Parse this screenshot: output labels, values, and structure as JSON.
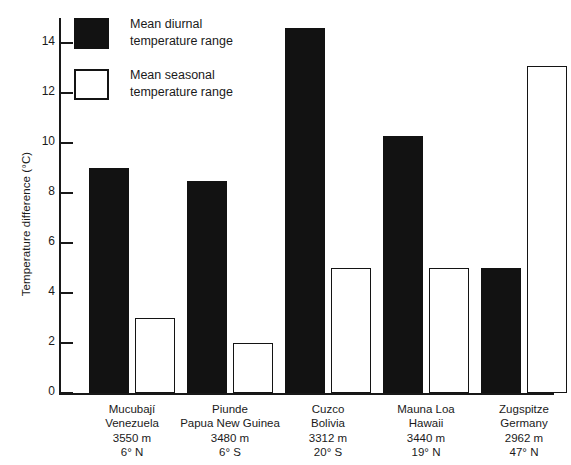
{
  "chart_data": {
    "type": "bar",
    "title": "",
    "xlabel": "",
    "ylabel": "Temperature difference (°C)",
    "ylim": [
      0,
      15
    ],
    "yticks": [
      0,
      2,
      4,
      6,
      8,
      10,
      12,
      14
    ],
    "ytick_labels": [
      "0",
      "2",
      "4",
      "6",
      "8",
      "10",
      "12",
      "14"
    ],
    "grid": false,
    "legend_position": "upper-left-inside",
    "categories": [
      "Mucubají Venezuela 3550 m 6° N",
      "Piunde Papua New Guinea 3480 m 6° S",
      "Cuzco Bolivia 3312 m 20° S",
      "Mauna Loa Hawaii 3440 m 19° N",
      "Zugspitze Germany 2962 m 47° N"
    ],
    "series": [
      {
        "name": "Mean diurnal temperature range",
        "values": [
          9.0,
          8.5,
          14.6,
          10.3,
          5.0
        ]
      },
      {
        "name": "Mean seasonal temperature range",
        "values": [
          3.0,
          2.0,
          5.0,
          5.0,
          13.1
        ]
      }
    ]
  },
  "axes": {
    "y_title": "Temperature difference (°C)"
  },
  "legend": {
    "items": [
      {
        "label_line1": "Mean diurnal",
        "label_line2": "temperature range",
        "swatch": "filled"
      },
      {
        "label_line1": "Mean seasonal",
        "label_line2": "temperature range",
        "swatch": "hollow"
      }
    ]
  },
  "sites": [
    {
      "name": "Mucubají",
      "country": "Venezuela",
      "elevation": "3550 m",
      "latitude": "6° N"
    },
    {
      "name": "Piunde",
      "country": "Papua New Guinea",
      "elevation": "3480 m",
      "latitude": "6° S"
    },
    {
      "name": "Cuzco",
      "country": "Bolivia",
      "elevation": "3312 m",
      "latitude": "20° S"
    },
    {
      "name": "Mauna Loa",
      "country": "Hawaii",
      "elevation": "3440 m",
      "latitude": "19° N"
    },
    {
      "name": "Zugspitze",
      "country": "Germany",
      "elevation": "2962 m",
      "latitude": "47° N"
    }
  ],
  "colors": {
    "diurnal_fill": "#121212",
    "seasonal_fill": "#ffffff",
    "outline": "#141414",
    "axis": "#181818",
    "background": "#ffffff"
  }
}
